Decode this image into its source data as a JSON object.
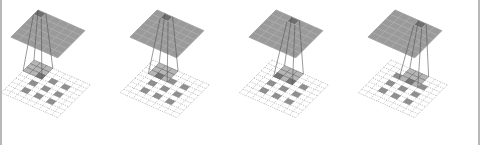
{
  "diagram": {
    "title": "",
    "input_grid_size": 9,
    "input_cells": [
      [
        2,
        2
      ],
      [
        2,
        4
      ],
      [
        2,
        6
      ],
      [
        4,
        2
      ],
      [
        4,
        4
      ],
      [
        4,
        6
      ],
      [
        6,
        2
      ],
      [
        6,
        4
      ],
      [
        6,
        6
      ]
    ],
    "kernel_size": 3,
    "output_grid_size": 6,
    "panels": [
      {
        "step": 1,
        "kernel_row": 0,
        "kernel_col": 0,
        "output_row": 0,
        "output_col": 0
      },
      {
        "step": 2,
        "kernel_row": 0,
        "kernel_col": 1,
        "output_row": 0,
        "output_col": 1
      },
      {
        "step": 3,
        "kernel_row": 0,
        "kernel_col": 2,
        "output_row": 0,
        "output_col": 2
      },
      {
        "step": 4,
        "kernel_row": 0,
        "kernel_col": 3,
        "output_row": 0,
        "output_col": 3
      }
    ],
    "colors": {
      "output_fill": "#9a9a9a",
      "output_highlight": "#6e6e6e",
      "output_stroke": "#7a7a7a",
      "input_fill": "#8f8f8f",
      "kernel_fill": "#a8a8a8",
      "overlap_fill": "#707070",
      "grid_dash": "#9a9a9a",
      "projection_line": "#555555"
    }
  }
}
